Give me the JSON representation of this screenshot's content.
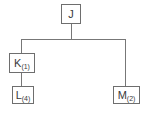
{
  "diagram": {
    "type": "tree",
    "nodes": [
      {
        "id": "J",
        "label": "J",
        "sub": ""
      },
      {
        "id": "K",
        "label": "K",
        "sub": "(1)"
      },
      {
        "id": "L",
        "label": "L",
        "sub": "(4)"
      },
      {
        "id": "M",
        "label": "M",
        "sub": "(2)"
      }
    ],
    "edges": [
      {
        "from": "J",
        "to": "K"
      },
      {
        "from": "J",
        "to": "M"
      },
      {
        "from": "K",
        "to": "L"
      }
    ]
  }
}
